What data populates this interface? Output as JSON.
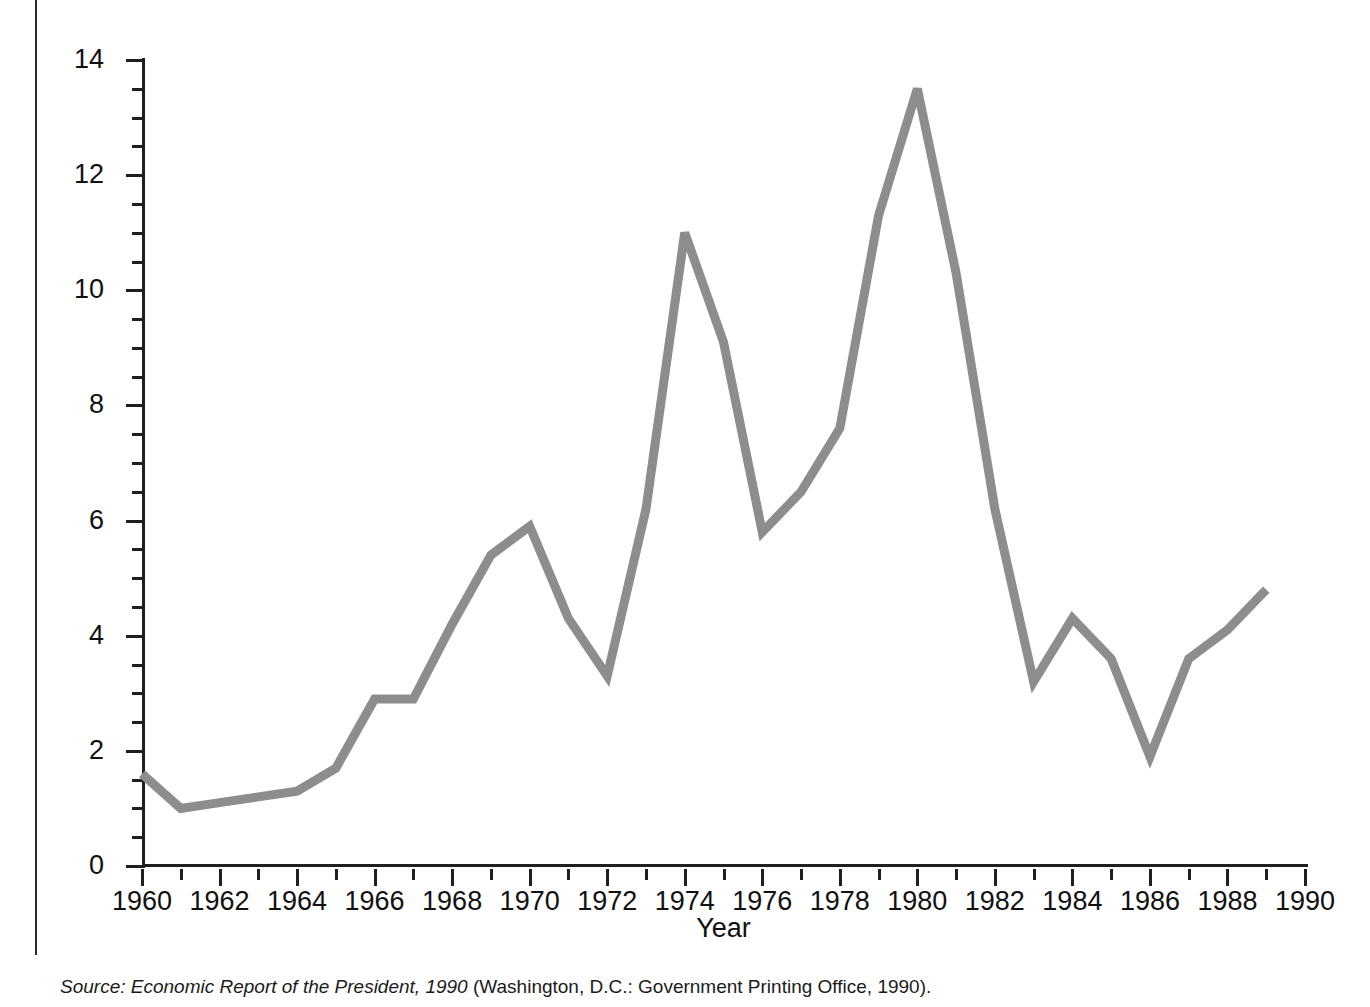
{
  "figure": {
    "y_axis_title": "Percentage increase in consumer price index",
    "x_axis_title": "Year",
    "line_color": "#8d8d8d",
    "axis_color": "#1f1f1f"
  },
  "source_note": {
    "prefix": "Source: Economic Report of the President, 1990",
    "suffix": " (Washington, D.C.: Government Printing Office, 1990)."
  },
  "chart_data": {
    "type": "line",
    "title": "",
    "xlabel": "Year",
    "ylabel": "Percentage increase in consumer price index",
    "xlim": [
      1960,
      1990
    ],
    "ylim": [
      0,
      14
    ],
    "grid": false,
    "legend": "none",
    "x_major_ticks": [
      1960,
      1962,
      1964,
      1966,
      1968,
      1970,
      1972,
      1974,
      1976,
      1978,
      1980,
      1982,
      1984,
      1986,
      1988,
      1990
    ],
    "x_minor_tick_step": 1,
    "y_major_ticks": [
      0,
      2,
      4,
      6,
      8,
      10,
      12,
      14
    ],
    "y_minor_tick_step": 0.5,
    "x_tick_labels": [
      "1960",
      "1962",
      "1964",
      "1966",
      "1968",
      "1970",
      "1972",
      "1974",
      "1976",
      "1978",
      "1980",
      "1982",
      "1984",
      "1986",
      "1988",
      "1990"
    ],
    "y_tick_labels": [
      "0",
      "2",
      "4",
      "6",
      "8",
      "10",
      "12",
      "14"
    ],
    "series": [
      {
        "name": "Percentage increase in consumer price index",
        "x": [
          1960,
          1961,
          1962,
          1963,
          1964,
          1965,
          1966,
          1967,
          1968,
          1969,
          1970,
          1971,
          1972,
          1973,
          1974,
          1975,
          1976,
          1977,
          1978,
          1979,
          1980,
          1981,
          1982,
          1983,
          1984,
          1985,
          1986,
          1987,
          1988,
          1989
        ],
        "values": [
          1.6,
          1.0,
          1.1,
          1.2,
          1.3,
          1.7,
          2.9,
          2.9,
          4.2,
          5.4,
          5.9,
          4.3,
          3.3,
          6.2,
          11.0,
          9.1,
          5.8,
          6.5,
          7.6,
          11.3,
          13.5,
          10.3,
          6.2,
          3.2,
          4.3,
          3.6,
          1.9,
          3.6,
          4.1,
          4.8
        ]
      }
    ]
  }
}
